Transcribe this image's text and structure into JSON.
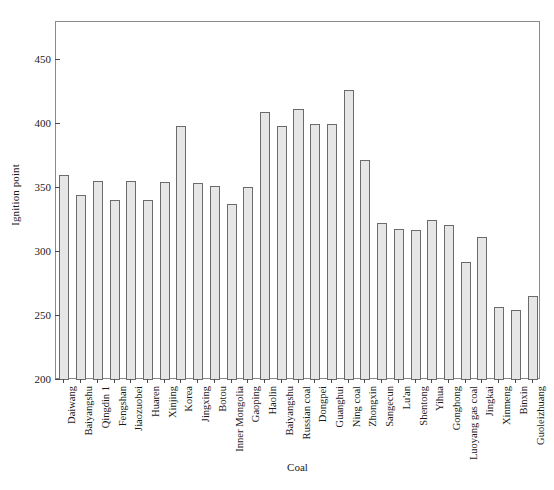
{
  "chart_data": {
    "type": "bar",
    "title": "",
    "xlabel": "Coal",
    "ylabel": "Ignition point",
    "ylim": [
      200,
      480
    ],
    "yticks": [
      200,
      250,
      300,
      350,
      400,
      450
    ],
    "grid": false,
    "legend": null,
    "bar_fill_color": "#e6e6e6",
    "bar_edge_color": "#6b6b6b",
    "categories": [
      "Daiwang",
      "Baiyangshu",
      "Qingdin 1",
      "Fengshan",
      "Jiaozuobei",
      "Huaren",
      "Xinjing",
      "Korea",
      "Jingxing",
      "Botou",
      "Inner Mongolia",
      "Gaoping",
      "Haolin",
      "Baiyangshu",
      "Russian coal",
      "Dongpei",
      "Guanghui",
      "Ning coal",
      "Zhongxin",
      "Sangecun",
      "Lu'an",
      "Shentong",
      "Yihua",
      "Gonghong",
      "Luoyang gas coal",
      "Jingkai",
      "Xinmeng",
      "Binxin",
      "Guoleizhuang"
    ],
    "values": [
      360,
      345,
      356,
      341,
      356,
      341,
      355,
      399,
      354,
      352,
      338,
      351,
      410,
      399,
      412,
      400,
      400,
      427,
      372,
      323,
      318,
      317,
      325,
      321,
      292,
      312,
      257,
      255,
      266
    ]
  }
}
